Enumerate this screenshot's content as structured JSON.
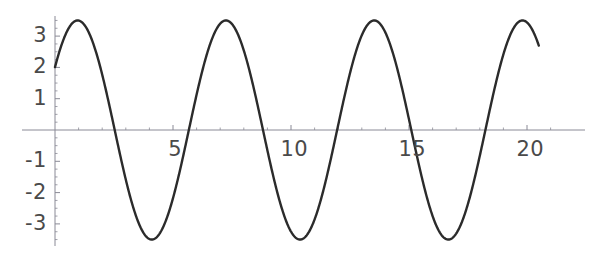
{
  "chart_data": {
    "type": "line",
    "title": "",
    "subtitle": "",
    "xlabel": "",
    "ylabel": "",
    "xlim": [
      -0.6,
      21.5
    ],
    "ylim": [
      -3.9,
      3.9
    ],
    "grid": false,
    "legend": null,
    "axis_style": {
      "axis_color": "#8a8a96",
      "curve_color": "#2b2b2b",
      "curve_width": 2.4,
      "background": "#ffffff",
      "tick_label_color": "#4a4a4a"
    },
    "x_ticks": [
      5,
      10,
      15,
      20
    ],
    "x_tick_labels": [
      "5",
      "10",
      "15",
      "20"
    ],
    "x_minor_tick_step": 1,
    "y_ticks": [
      3,
      2,
      1,
      -1,
      -2,
      -3
    ],
    "y_tick_labels": [
      "3",
      "2",
      "1",
      "-1",
      "-2",
      "-3"
    ],
    "y_minor_tick_step": 0.25,
    "series": [
      {
        "name": "sinusoid",
        "description": "damped-free sinusoid, amplitude 3.5, period 2*pi, value 2 at x=0 and decreasing",
        "amplitude": 3.5,
        "period": 6.2832,
        "phase_rad": 2.53,
        "equation": "y = 3.5*sin(2.53 - x)",
        "x_start": 0,
        "x_end": 20.5,
        "x": [
          0,
          0.5,
          0.76,
          1,
          1.5,
          2,
          2.5,
          3,
          3.5,
          3.9,
          4,
          4.5,
          5,
          5.4,
          5.5,
          6,
          6.5,
          7,
          7.05,
          7.5,
          8,
          8.5,
          9,
          9.5,
          10,
          10.2,
          10.5,
          11,
          11.5,
          11.7,
          12,
          12.5,
          13,
          13.3,
          13.5,
          14,
          14.5,
          15,
          15.5,
          16,
          16.5,
          17,
          17.5,
          18,
          18.5,
          19,
          19.5,
          19.6,
          20,
          20.5
        ],
        "y": [
          2.0,
          0.88,
          0.0,
          -0.58,
          -1.9,
          -2.86,
          -3.4,
          -3.47,
          -3.07,
          -2.54,
          -2.35,
          -1.25,
          0.02,
          1.17,
          1.42,
          2.57,
          3.29,
          3.49,
          3.49,
          3.14,
          2.32,
          1.17,
          -0.14,
          -1.42,
          -2.49,
          -2.82,
          -3.21,
          -3.49,
          -3.33,
          -3.18,
          -2.76,
          -1.73,
          -0.43,
          0.4,
          0.93,
          2.12,
          3.03,
          3.45,
          3.38,
          2.8,
          1.81,
          0.56,
          -0.74,
          -1.93,
          -2.88,
          -3.4,
          -3.47,
          -3.44,
          -3.04,
          -2.15
        ]
      }
    ],
    "annotations": []
  },
  "geometry": {
    "origin_x_px": 55,
    "origin_y_px": 130,
    "px_per_unit_x": 23.6,
    "px_per_unit_y": 31.3,
    "x_axis_left_px": 22,
    "x_axis_right_px": 585,
    "y_axis_top_px": 16,
    "y_axis_bottom_px": 246
  }
}
